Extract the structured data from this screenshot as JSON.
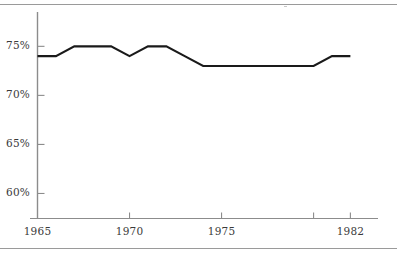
{
  "chart_data": {
    "type": "line",
    "title": "",
    "subtitle": "",
    "xlabel": "",
    "ylabel": "",
    "x": [
      1965,
      1966,
      1967,
      1968,
      1969,
      1970,
      1971,
      1972,
      1973,
      1974,
      1975,
      1976,
      1977,
      1978,
      1979,
      1980,
      1981,
      1982
    ],
    "values": [
      74,
      74,
      75,
      75,
      75,
      74,
      75,
      75,
      74,
      73,
      73,
      73,
      73,
      73,
      73,
      73,
      74,
      74
    ],
    "series": [
      {
        "name": "series-1",
        "values": [
          74,
          74,
          75,
          75,
          75,
          74,
          75,
          75,
          74,
          73,
          73,
          73,
          73,
          73,
          73,
          73,
          74,
          74
        ]
      }
    ],
    "xlim": [
      1965,
      1983.5
    ],
    "ylim": [
      57.5,
      78.5
    ],
    "grid": false,
    "legend": false,
    "legend_position": "none",
    "line_color": "#1a1a1a",
    "axis_color": "#8c8c8c",
    "y_ticks": [
      60,
      65,
      70,
      75
    ],
    "y_tick_labels": [
      "60%",
      "65%",
      "70%",
      "75%"
    ],
    "x_ticks": [
      1965,
      1970,
      1975,
      1980,
      1982
    ],
    "x_tick_labels": [
      "1965",
      "1970",
      "1975",
      "",
      "1982"
    ],
    "x_labeled_ticks": [
      {
        "value": 1965,
        "label": "1965"
      },
      {
        "value": 1970,
        "label": "1970"
      },
      {
        "value": 1975,
        "label": "1975"
      },
      {
        "value": 1982,
        "label": "1982"
      }
    ]
  },
  "axes": {
    "y_tick_0": "60%",
    "y_tick_1": "65%",
    "y_tick_2": "70%",
    "y_tick_3": "75%",
    "x_tick_0": "1965",
    "x_tick_1": "1970",
    "x_tick_2": "1975",
    "x_tick_3": "1982"
  },
  "colors": {
    "line": "#1a1a1a",
    "axis": "#8c8c8c",
    "rule": "#9a9a9a",
    "text": "#3a3a3a",
    "background": "#ffffff"
  }
}
